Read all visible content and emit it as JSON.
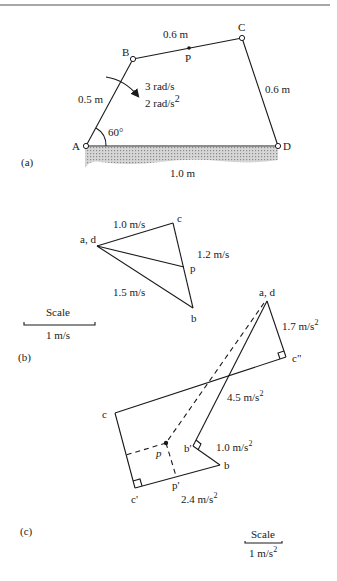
{
  "figure": {
    "panels": {
      "a": {
        "label": "(a)",
        "joints": {
          "A": "A",
          "B": "B",
          "C": "C",
          "D": "D",
          "P": "P"
        },
        "links": {
          "AB": "0.5 m",
          "BC": "0.6 m",
          "CD": "0.6 m",
          "AD": "1.0 m"
        },
        "angle": "60°",
        "angular_velocity": "3 rad/s",
        "angular_acceleration": "2 rad/s",
        "angular_acceleration_exp": "2"
      },
      "b": {
        "label": "(b)",
        "points": {
          "ad": "a, d",
          "c": "c",
          "p": "p",
          "b": "b"
        },
        "vectors": {
          "dc": "1.0 m/s",
          "cb": "1.2 m/s",
          "ab": "1.5 m/s"
        },
        "scale": {
          "title": "Scale",
          "value": "1 m/s"
        }
      },
      "c": {
        "label": "(c)",
        "points": {
          "ad": "a, d",
          "c2": "c\"",
          "c": "c",
          "c1": "c'",
          "p": "p",
          "p1": "p'",
          "b1": "b'",
          "b": "b"
        },
        "vectors": {
          "dc2": "1.7 m/s",
          "ab1": "4.5 m/s",
          "b1b": "1.0 m/s",
          "c1p1": "2.4 m/s"
        },
        "exp": "2",
        "scale": {
          "title": "Scale",
          "value": "1 m/s",
          "exp": "2"
        }
      }
    }
  }
}
